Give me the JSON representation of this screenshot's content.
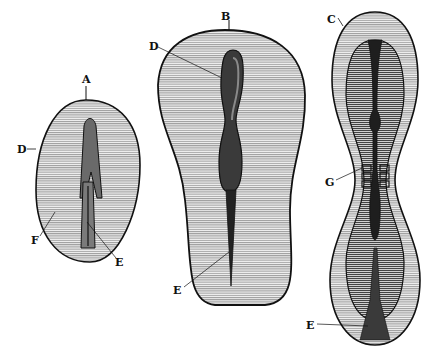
{
  "figure": {
    "colors": {
      "ink": "#111111",
      "paper": "#ffffff",
      "fill_light": "#d8d8d8",
      "fill_mid": "#a8a8a8",
      "fill_dark": "#2a2a2a"
    },
    "panels": [
      {
        "id": "A",
        "label": "A",
        "labels": {
          "top": "A",
          "left": "D",
          "bottom_left": "F",
          "bottom_right": "E"
        }
      },
      {
        "id": "B",
        "label": "B",
        "labels": {
          "top": "B",
          "upper_left": "D",
          "lower_left": "E"
        }
      },
      {
        "id": "C",
        "label": "C",
        "labels": {
          "top": "C",
          "middle_left": "G",
          "bottom_left": "E"
        }
      }
    ]
  }
}
